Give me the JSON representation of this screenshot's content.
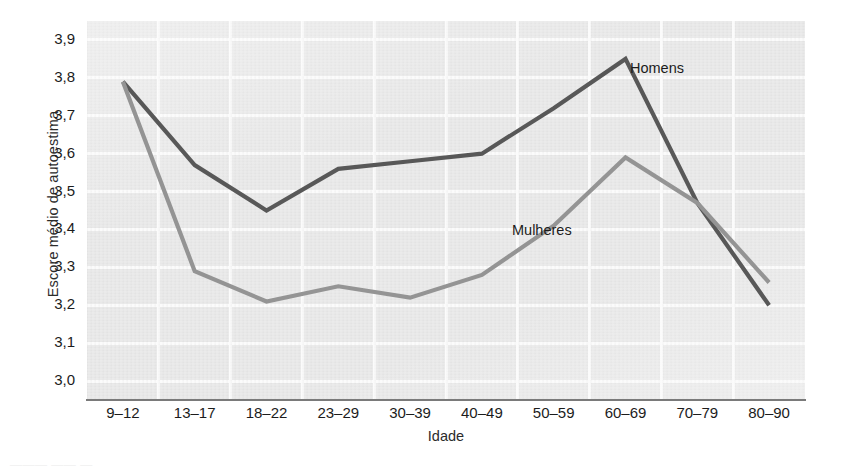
{
  "chart_data": {
    "type": "line",
    "title": "",
    "xlabel": "Idade",
    "ylabel": "Escore médio de autoestima",
    "categories": [
      "9–12",
      "13–17",
      "18–22",
      "23–29",
      "30–39",
      "40–49",
      "50–59",
      "60–69",
      "70–79",
      "80–90"
    ],
    "ylim": [
      2.95,
      3.95
    ],
    "yticks": [
      "3,0",
      "3,1",
      "3,2",
      "3,3",
      "3,4",
      "3,5",
      "3,6",
      "3,7",
      "3,8",
      "3,9"
    ],
    "ytick_values": [
      3.0,
      3.1,
      3.2,
      3.3,
      3.4,
      3.5,
      3.6,
      3.7,
      3.8,
      3.9
    ],
    "grid": true,
    "legend_position": "inline-annotations",
    "series": [
      {
        "name": "Homens",
        "color": "#585858",
        "values": [
          3.79,
          3.57,
          3.45,
          3.56,
          3.58,
          3.6,
          3.72,
          3.85,
          3.47,
          3.2
        ]
      },
      {
        "name": "Mulheres",
        "color": "#949494",
        "values": [
          3.79,
          3.29,
          3.21,
          3.25,
          3.22,
          3.28,
          3.41,
          3.59,
          3.47,
          3.26
        ]
      }
    ],
    "annotations": [
      {
        "text": "Homens",
        "series": "Homens"
      },
      {
        "text": "Mulheres",
        "series": "Mulheres"
      }
    ]
  },
  "figure": {
    "plot_background": "#e8e8e8",
    "gridline_color": "#fbfbfb",
    "axis_color": "#7a7a7a",
    "caption_remnant": "———  ——  —"
  }
}
